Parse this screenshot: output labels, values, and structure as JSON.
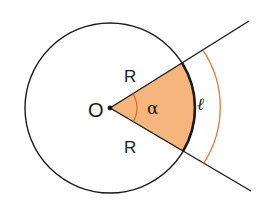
{
  "diagram": {
    "colors": {
      "stroke": "#1a1a1a",
      "sector_fill": "#F7B57E",
      "accent": "#E07A3A"
    },
    "center": {
      "label": "O",
      "x": 110,
      "y": 108
    },
    "circle": {
      "cx": 110,
      "cy": 108,
      "r": 85
    },
    "rays": [
      {
        "name": "upper-ray",
        "x1": 110,
        "y1": 108,
        "x2": 249,
        "y2": 21
      },
      {
        "name": "lower-ray",
        "x1": 110,
        "y1": 108,
        "x2": 251,
        "y2": 191
      }
    ],
    "labels": {
      "radius_upper": "R",
      "radius_lower": "R",
      "angle": "α",
      "center": "O",
      "arc_length": "ℓ"
    }
  }
}
